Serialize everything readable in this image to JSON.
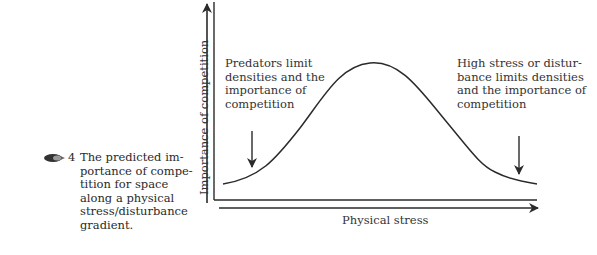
{
  "figure": {
    "number": "4",
    "caption_lines": [
      "The predicted im-",
      "portance of compe-",
      "tition for space",
      "along a physical",
      "stress/disturbance",
      "gradient."
    ],
    "icon": "book-pointer-icon"
  },
  "axes": {
    "y_label": "Importance of competition",
    "x_label": "Physical stress"
  },
  "annotations": {
    "left": [
      "Predators limit",
      "densities and the",
      "importance of",
      "competition"
    ],
    "right": [
      "High stress or distur-",
      "bance  limits densities",
      "and the importance of",
      "competition"
    ]
  },
  "curve": {
    "shape": "hump",
    "description": "Importance of competition peaks at intermediate physical stress"
  },
  "colors": {
    "line": "#2a2a2a",
    "text": "#333333",
    "background": "#ffffff"
  }
}
